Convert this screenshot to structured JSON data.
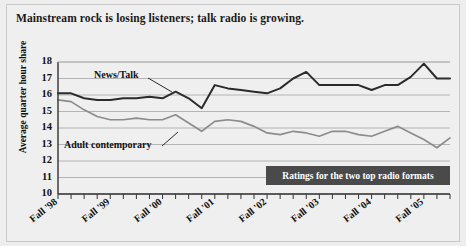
{
  "title": "Mainstream rock is losing listeners; talk radio is growing.",
  "caption": "Ratings for the two top radio formats",
  "ylabel": "Average quarter hour share",
  "series_labels": {
    "news_talk": "News/Talk",
    "adult_contemporary": "Adult contemporary"
  },
  "colors": {
    "news_talk": "#2b2b2b",
    "adult_contemporary": "#8c8c8c",
    "grid": "#b4b4b4",
    "axis": "#333333",
    "banner": "#4a4a4a",
    "banner_text": "#ffffff",
    "background": "#efefef"
  },
  "chart_data": {
    "type": "line",
    "title": "Mainstream rock is losing listeners; talk radio is growing.",
    "subtitle": "Ratings for the two top radio formats",
    "xlabel": "",
    "ylabel": "Average quarter hour share",
    "ylim": [
      10,
      18
    ],
    "yticks": [
      10,
      11,
      12,
      13,
      14,
      15,
      16,
      17,
      18
    ],
    "grid": true,
    "legend": "inline-annotations",
    "x_major_labels": [
      "Fall '98",
      "Fall '99",
      "Fall '00",
      "Fall '01",
      "Fall '02",
      "Fall '03",
      "Fall '04",
      "Fall '05"
    ],
    "x_minor_ticks_per_major": 4,
    "x": [
      0,
      1,
      2,
      3,
      4,
      5,
      6,
      7,
      8,
      9,
      10,
      11,
      12,
      13,
      14,
      15,
      16,
      17,
      18,
      19,
      20,
      21,
      22,
      23,
      24,
      25,
      26,
      27,
      28,
      29,
      30
    ],
    "series": [
      {
        "name": "News/Talk",
        "color": "#2b2b2b",
        "values": [
          16.1,
          16.1,
          15.8,
          15.7,
          15.7,
          15.8,
          15.8,
          15.9,
          15.8,
          16.2,
          15.8,
          15.2,
          16.6,
          16.4,
          16.3,
          16.2,
          16.1,
          16.4,
          17.0,
          17.4,
          16.6,
          16.6,
          16.6,
          16.6,
          16.3,
          16.6,
          16.6,
          17.1,
          17.9,
          17.0,
          17.0
        ]
      },
      {
        "name": "Adult contemporary",
        "color": "#8c8c8c",
        "values": [
          15.7,
          15.6,
          15.1,
          14.7,
          14.5,
          14.5,
          14.6,
          14.5,
          14.5,
          14.8,
          14.3,
          13.8,
          14.4,
          14.5,
          14.4,
          14.1,
          13.7,
          13.6,
          13.8,
          13.7,
          13.5,
          13.8,
          13.8,
          13.6,
          13.5,
          13.8,
          14.1,
          13.7,
          13.3,
          12.8,
          13.4
        ]
      }
    ]
  }
}
